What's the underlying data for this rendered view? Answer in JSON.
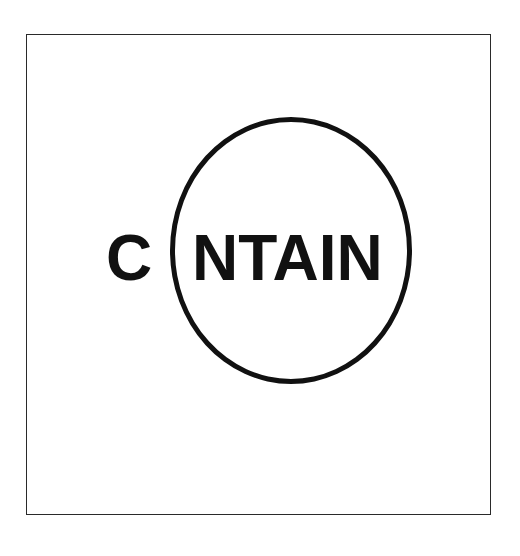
{
  "logo": {
    "first_letter": "C",
    "rest": "NTAIN",
    "full_word": "CONTAIN",
    "circle_replaces": "O",
    "ink_color": "#111111",
    "background": "#ffffff"
  }
}
